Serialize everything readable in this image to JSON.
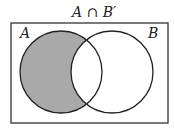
{
  "title": "A ∩ B′",
  "sets": [
    {
      "label": "A",
      "shaded_part": "A only"
    },
    {
      "label": "B"
    }
  ],
  "colors": {
    "shade": "#a9a9a9",
    "stroke": "#222222",
    "background": "#ffffff"
  }
}
